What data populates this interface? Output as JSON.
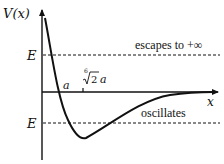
{
  "diagram": {
    "y_axis_label": "V(x)",
    "x_axis_label": "x",
    "levels": [
      {
        "label": "E",
        "annotation": "escapes to +∞"
      },
      {
        "label": "E",
        "annotation": "oscillates"
      }
    ],
    "x_marks": [
      {
        "label": "a"
      },
      {
        "label_root_index": "6",
        "label_radicand": "2",
        "label_suffix": "a"
      }
    ],
    "colors": {
      "ink": "#111111",
      "background": "#ffffff"
    }
  }
}
